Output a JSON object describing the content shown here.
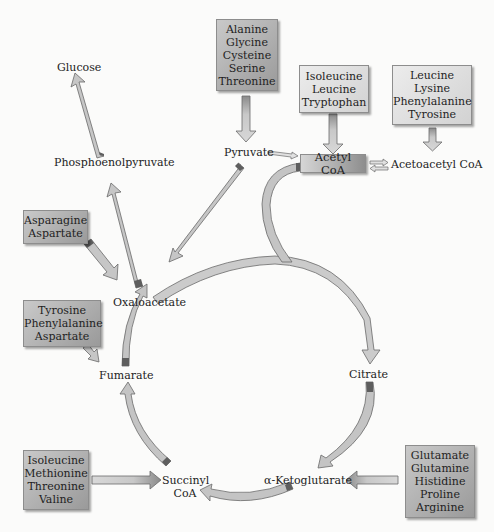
{
  "diagram": {
    "type": "metabolic-pathway",
    "metabolites": {
      "glucose": "Glucose",
      "pep": "Phosphoenolpyruvate",
      "pyruvate": "Pyruvate",
      "acetyl_coa": "Acetyl CoA",
      "acetoacetyl_coa": "Acetoacetyl CoA",
      "oxaloacetate": "Oxaloacetate",
      "citrate": "Citrate",
      "alpha_ketoglutarate": "α-Ketoglutarate",
      "succinyl_coa_line1": "Succinyl",
      "succinyl_coa_line2": "CoA",
      "fumarate": "Fumarate"
    },
    "amino_acid_groups": {
      "to_pyruvate": [
        "Alanine",
        "Glycine",
        "Cysteine",
        "Serine",
        "Threonine"
      ],
      "to_acetyl_coa": [
        "Isoleucine",
        "Leucine",
        "Tryptophan"
      ],
      "to_acetoacetyl_coa": [
        "Leucine",
        "Lysine",
        "Phenylalanine",
        "Tyrosine"
      ],
      "to_oxaloacetate": [
        "Asparagine",
        "Aspartate"
      ],
      "to_fumarate": [
        "Tyrosine",
        "Phenylalanine",
        "Aspartate"
      ],
      "to_succinyl_coa": [
        "Isoleucine",
        "Methionine",
        "Threonine",
        "Valine"
      ],
      "to_alpha_ketoglutarate": [
        "Glutamate",
        "Glutamine",
        "Histidine",
        "Proline",
        "Arginine"
      ]
    },
    "edges": [
      {
        "from": "Phosphoenolpyruvate",
        "to": "Glucose"
      },
      {
        "from": "Oxaloacetate",
        "to": "Phosphoenolpyruvate"
      },
      {
        "from": "Pyruvate",
        "to": "Oxaloacetate"
      },
      {
        "from": "Pyruvate",
        "to": "Acetyl CoA"
      },
      {
        "from": "Acetyl CoA",
        "to": "Acetoacetyl CoA",
        "reversible": true
      },
      {
        "from": "Acetyl CoA",
        "to": "Citrate"
      },
      {
        "from": "Oxaloacetate",
        "to": "Citrate"
      },
      {
        "from": "Citrate",
        "to": "α-Ketoglutarate"
      },
      {
        "from": "α-Ketoglutarate",
        "to": "Succinyl CoA"
      },
      {
        "from": "Succinyl CoA",
        "to": "Fumarate"
      },
      {
        "from": "Fumarate",
        "to": "Oxaloacetate"
      }
    ],
    "colors": {
      "arrow_fill": "#c4c4c4",
      "arrow_dark": "#6a6a6a",
      "box_dark": "#b0b0b0",
      "box_light": "#e2e2e2",
      "background": "#fbfbfa"
    }
  }
}
